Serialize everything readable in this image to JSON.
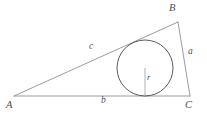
{
  "figure": {
    "kind": "geometry-diagram",
    "width": 207,
    "height": 114,
    "background_color": "#ffffff",
    "line_color": "#8e9097",
    "circle_color": "#55585e",
    "label_color": "#4c4f55"
  },
  "vertices": [
    {
      "id": "A",
      "label": "A",
      "x": 14,
      "y": 96,
      "label_x": 10,
      "label_y": 99
    },
    {
      "id": "B",
      "label": "B",
      "x": 178,
      "y": 22,
      "label_x": 170,
      "label_y": 5
    },
    {
      "id": "C",
      "label": "C",
      "x": 190,
      "y": 96,
      "label_x": 186,
      "label_y": 99
    }
  ],
  "sides": [
    {
      "id": "a",
      "label": "a",
      "between": "B-C",
      "label_x": 188,
      "label_y": 51
    },
    {
      "id": "b",
      "label": "b",
      "between": "A-C",
      "label_x": 102,
      "label_y": 99
    },
    {
      "id": "c",
      "label": "c",
      "between": "A-B",
      "label_x": 90,
      "label_y": 45
    }
  ],
  "incircle": {
    "center_x": 145,
    "center_y": 68,
    "radius": 28,
    "radius_label": "r",
    "radius_label_x": 148,
    "radius_label_y": 76,
    "radius_line": {
      "x1": 145,
      "y1": 68,
      "x2": 145,
      "y2": 96
    }
  },
  "paths": {
    "triangle": "M 14 96 L 178 22 L 190 96 Z"
  }
}
